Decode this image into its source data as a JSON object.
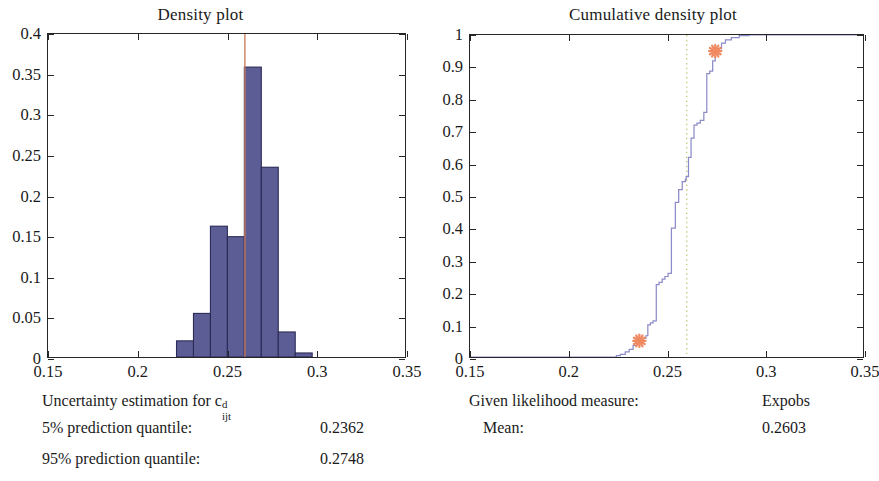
{
  "left": {
    "title": "Density plot",
    "axis": {
      "x_ticks": [
        "0.15",
        "0.2",
        "0.25",
        "0.3",
        "0.35"
      ],
      "y_ticks": [
        "0",
        "0.05",
        "0.1",
        "0.15",
        "0.2",
        "0.25",
        "0.3",
        "0.35",
        "0.4"
      ]
    },
    "caption": {
      "heading_prefix": "Uncertainty estimation for c",
      "heading_sup": "d",
      "heading_sub": "ijt",
      "row1_label": "5% prediction quantile:",
      "row1_value": "0.2362",
      "row2_label": "95% prediction quantile:",
      "row2_value": "0.2748"
    }
  },
  "right": {
    "title": "Cumulative density plot",
    "axis": {
      "x_ticks": [
        "0.15",
        "0.2",
        "0.25",
        "0.3",
        "0.35"
      ],
      "y_ticks": [
        "0",
        "0.1",
        "0.2",
        "0.3",
        "0.4",
        "0.5",
        "0.6",
        "0.7",
        "0.8",
        "0.9",
        "1"
      ]
    },
    "caption": {
      "row0_label": "Given likelihood measure:",
      "row0_value": "Expobs",
      "row1_label": "Mean:",
      "row1_value": "0.2603"
    }
  },
  "colors": {
    "bar_fill": "#5d5d95",
    "bar_edge": "#2b2b57",
    "step_line": "#8c8cc8",
    "marker": "#f08a62",
    "mean_line": "#c8c87a",
    "axis": "#262626",
    "quantile_line": "#c87a5a"
  },
  "chart_data": [
    {
      "type": "bar",
      "title": "Density plot",
      "xlabel": "",
      "ylabel": "",
      "xlim": [
        0.15,
        0.35
      ],
      "ylim": [
        0,
        0.4
      ],
      "grid": false,
      "legend": "none",
      "bin_edges": [
        0.222,
        0.2315,
        0.241,
        0.2505,
        0.26,
        0.2695,
        0.279,
        0.2885,
        0.298
      ],
      "categories": [
        "0.2268",
        "0.2363",
        "0.2458",
        "0.2553",
        "0.2648",
        "0.2743",
        "0.2838",
        "0.2933"
      ],
      "values": [
        0.02,
        0.054,
        0.162,
        0.149,
        0.359,
        0.235,
        0.031,
        0.005
      ],
      "annotations": [
        {
          "type": "vline",
          "x": 0.2603,
          "label": "mean",
          "color": "#c87a5a"
        }
      ]
    },
    {
      "type": "line",
      "subtype": "step",
      "title": "Cumulative density plot",
      "xlabel": "",
      "ylabel": "",
      "xlim": [
        0.15,
        0.35
      ],
      "ylim": [
        0,
        1
      ],
      "grid": false,
      "legend": "none",
      "series": [
        {
          "name": "empirical CDF",
          "x": [
            0.15,
            0.222,
            0.2245,
            0.2265,
            0.229,
            0.231,
            0.233,
            0.2348,
            0.2362,
            0.238,
            0.2395,
            0.2405,
            0.2418,
            0.2432,
            0.2448,
            0.2462,
            0.2478,
            0.2492,
            0.2508,
            0.2525,
            0.2545,
            0.2562,
            0.258,
            0.2596,
            0.26,
            0.2612,
            0.2625,
            0.264,
            0.2655,
            0.2672,
            0.269,
            0.2705,
            0.272,
            0.2735,
            0.2748,
            0.2762,
            0.278,
            0.28,
            0.283,
            0.287,
            0.292,
            0.35
          ],
          "y": [
            0.0,
            0.0,
            0.004,
            0.008,
            0.016,
            0.024,
            0.036,
            0.046,
            0.05,
            0.058,
            0.066,
            0.1,
            0.106,
            0.112,
            0.225,
            0.232,
            0.242,
            0.25,
            0.26,
            0.4,
            0.48,
            0.52,
            0.545,
            0.552,
            0.56,
            0.62,
            0.68,
            0.72,
            0.726,
            0.735,
            0.76,
            0.88,
            0.888,
            0.92,
            0.95,
            0.958,
            0.975,
            0.985,
            0.992,
            0.998,
            1.0,
            1.0
          ]
        }
      ],
      "annotations": [
        {
          "type": "vline",
          "x": 0.2603,
          "label": "Mean = 0.2603",
          "style": "dotted",
          "color": "#c8c87a"
        },
        {
          "type": "marker",
          "x": 0.2362,
          "y": 0.05,
          "label": "5% prediction quantile",
          "symbol": "asterisk",
          "color": "#f08a62"
        },
        {
          "type": "marker",
          "x": 0.2748,
          "y": 0.95,
          "label": "95% prediction quantile",
          "symbol": "asterisk",
          "color": "#f08a62"
        }
      ]
    }
  ]
}
